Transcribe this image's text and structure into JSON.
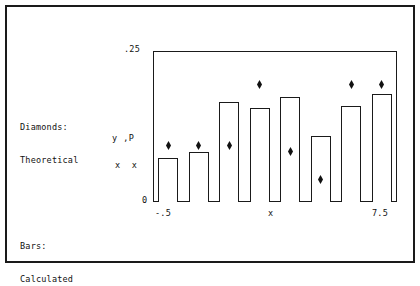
{
  "figure": {
    "background": "#ffffff",
    "ink": "#1a1a1a"
  },
  "legend": {
    "groups": [
      {
        "title": "Diamonds:",
        "subtitle": "Theoretical"
      },
      {
        "title": "Bars:",
        "subtitle": "Calculated"
      }
    ]
  },
  "axes": {
    "y_top_label": ".25",
    "y_bottom_label": "0",
    "x_left_label": "-.5",
    "x_center_label": "x",
    "x_right_label": "7.5",
    "y_title_row1": "y ,P",
    "y_title_row2": "x  x"
  },
  "chart_data": {
    "type": "bar",
    "title": "",
    "xlabel": "x",
    "ylabel": "y_x , P_x",
    "xlim": [
      -0.5,
      7.5
    ],
    "ylim": [
      0,
      0.25
    ],
    "grid": false,
    "legend_position": "outside-left",
    "categories": [
      "0",
      "1",
      "2",
      "3",
      "4",
      "5",
      "6",
      "7"
    ],
    "series": [
      {
        "name": "Calculated",
        "marker": "bar",
        "values": [
          0.073,
          0.083,
          0.166,
          0.156,
          0.174,
          0.109,
          0.159,
          0.179
        ]
      },
      {
        "name": "Theoretical",
        "marker": "diamond",
        "values": [
          0.093,
          0.093,
          0.093,
          0.195,
          0.083,
          0.038,
          0.195,
          0.194
        ]
      }
    ]
  }
}
